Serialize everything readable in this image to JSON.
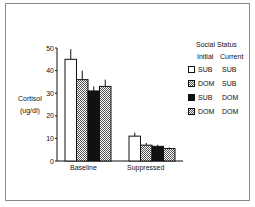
{
  "chart_data": {
    "type": "bar",
    "title": "",
    "xlabel": "",
    "ylabel": "Cortisol (ug/dl)",
    "ylim": [
      0,
      50
    ],
    "yticks": [
      0,
      10,
      20,
      30,
      40,
      50
    ],
    "grid": false,
    "legend_position": "right",
    "legend_title": "Social Status",
    "legend_columns": [
      "Initial",
      "Current"
    ],
    "categories": [
      "Baseline",
      "Suppressed"
    ],
    "series": [
      {
        "name": "SUB → SUB",
        "initial": "SUB",
        "current": "SUB",
        "fill": "white",
        "values": [
          45,
          11
        ],
        "errors": [
          4.5,
          1.5
        ]
      },
      {
        "name": "DOM → SUB",
        "initial": "DOM",
        "current": "SUB",
        "fill": "hatched",
        "values": [
          36,
          7
        ],
        "errors": [
          4,
          1
        ]
      },
      {
        "name": "SUB → DOM",
        "initial": "SUB",
        "current": "DOM",
        "fill": "black",
        "values": [
          31,
          6.5
        ],
        "errors": [
          2,
          0.7
        ]
      },
      {
        "name": "DOM → DOM",
        "initial": "DOM",
        "current": "DOM",
        "fill": "hatched",
        "values": [
          33,
          5.5
        ],
        "errors": [
          3,
          0.5
        ]
      }
    ]
  },
  "labels": {
    "y_title_line1": "Cortisol",
    "y_title_line2": "(ug/dl)",
    "legend_title": "Social Status",
    "legend_col1": "Initial",
    "legend_col2": "Current",
    "legend_rows": [
      {
        "initial": "SUB",
        "current": "SUB"
      },
      {
        "initial": "DOM",
        "current": "SUB"
      },
      {
        "initial": "SUB",
        "current": "DOM"
      },
      {
        "initial": "DOM",
        "current": "DOM"
      }
    ],
    "x_categories": [
      "Baseline",
      "Suppressed"
    ],
    "y_ticks": [
      "0",
      "10",
      "20",
      "30",
      "40",
      "50"
    ]
  },
  "colors": {
    "black": "#111111",
    "white": "#ffffff",
    "hatch": "#9a9a9a",
    "frame": "#8a8a8a"
  }
}
